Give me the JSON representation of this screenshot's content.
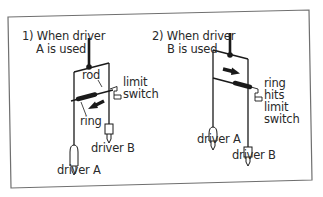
{
  "diagram": {
    "panels": [
      {
        "id": "panel-1",
        "title_line1": "1) When driver",
        "title_line2": "A is used",
        "labels": {
          "rod": "rod",
          "limit_switch_line1": "limit",
          "limit_switch_line2": "switch",
          "ring": "ring",
          "driver_a": "driver A",
          "driver_b": "driver B"
        },
        "arrow_direction": "left"
      },
      {
        "id": "panel-2",
        "title_line1": "2) When driver",
        "title_line2": "B is used",
        "labels": {
          "ring_hits_line1": "ring",
          "ring_hits_line2": "hits",
          "ring_hits_line3": "limit",
          "ring_hits_line4": "switch",
          "driver_a": "driver A",
          "driver_b": "driver B"
        },
        "arrow_direction": "right"
      }
    ],
    "colors": {
      "stroke": "#1a1a1a",
      "frame": "#6f6f6f",
      "text": "#2a2a2a",
      "background": "#ffffff"
    }
  }
}
